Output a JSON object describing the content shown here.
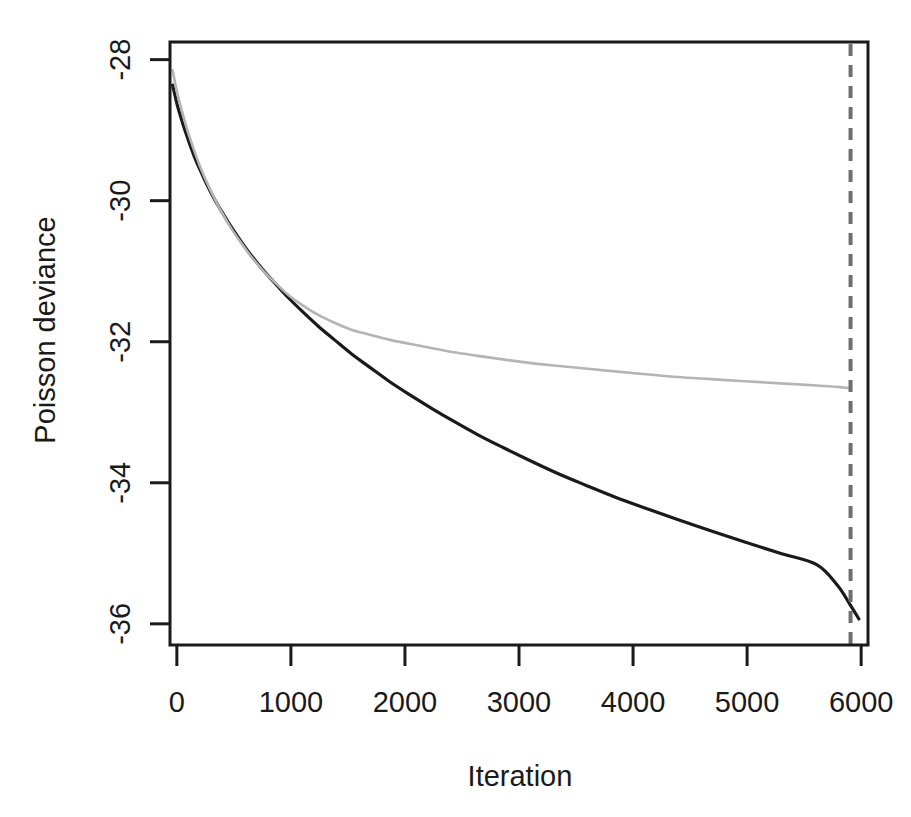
{
  "chart_data": {
    "type": "line",
    "title": "",
    "xlabel": "Iteration",
    "ylabel": "Poisson deviance",
    "xlim": [
      -60,
      6060
    ],
    "ylim": [
      -36.3,
      -27.75
    ],
    "grid": false,
    "legend": "none",
    "xticks": [
      0,
      1000,
      2000,
      3000,
      4000,
      5000,
      6000
    ],
    "xtick_labels": [
      "0",
      "1000",
      "2000",
      "3000",
      "4000",
      "5000",
      "6000"
    ],
    "yticks": [
      -28,
      -30,
      -32,
      -34,
      -36
    ],
    "ytick_labels": [
      "-28",
      "-30",
      "-32",
      "-34",
      "-36"
    ],
    "series": [
      {
        "name": "training deviance",
        "color": "#1a1a1a",
        "width": 3.2,
        "dash": "none",
        "x": [
          -37,
          0,
          30,
          60,
          100,
          150,
          200,
          260,
          330,
          400,
          480,
          560,
          650,
          750,
          860,
          980,
          1100,
          1240,
          1380,
          1530,
          1690,
          1860,
          2040,
          2230,
          2430,
          2640,
          2860,
          3090,
          3330,
          3580,
          3840,
          4110,
          4390,
          4680,
          4980,
          5290,
          5610,
          5790,
          5900,
          5980
        ],
        "y": [
          -28.36,
          -28.62,
          -28.79,
          -28.95,
          -29.14,
          -29.36,
          -29.55,
          -29.76,
          -29.98,
          -30.17,
          -30.38,
          -30.57,
          -30.77,
          -30.97,
          -31.17,
          -31.38,
          -31.57,
          -31.78,
          -31.97,
          -32.17,
          -32.36,
          -32.56,
          -32.75,
          -32.94,
          -33.13,
          -33.32,
          -33.5,
          -33.68,
          -33.86,
          -34.03,
          -34.2,
          -34.36,
          -34.52,
          -34.68,
          -34.84,
          -35.0,
          -35.16,
          -35.45,
          -35.72,
          -35.93
        ]
      },
      {
        "name": "cross-validation deviance",
        "color": "#b4b4b4",
        "width": 2.6,
        "dash": "none",
        "x": [
          -37,
          0,
          30,
          60,
          100,
          150,
          200,
          260,
          330,
          400,
          480,
          560,
          650,
          750,
          860,
          980,
          1100,
          1240,
          1380,
          1530,
          1690,
          1860,
          2040,
          2230,
          2430,
          2640,
          2860,
          3090,
          3330,
          3580,
          3840,
          4110,
          4390,
          4680,
          4980,
          5290,
          5610,
          5790,
          5907
        ],
        "y": [
          -28.15,
          -28.45,
          -28.64,
          -28.82,
          -29.04,
          -29.28,
          -29.5,
          -29.73,
          -29.97,
          -30.18,
          -30.4,
          -30.59,
          -30.79,
          -30.98,
          -31.16,
          -31.34,
          -31.48,
          -31.62,
          -31.73,
          -31.83,
          -31.9,
          -31.97,
          -32.03,
          -32.09,
          -32.15,
          -32.2,
          -32.25,
          -32.3,
          -32.34,
          -32.38,
          -32.42,
          -32.46,
          -32.5,
          -32.53,
          -32.56,
          -32.59,
          -32.62,
          -32.64,
          -32.66
        ]
      }
    ],
    "annotations": [
      {
        "name": "best-iteration-line",
        "type": "vline",
        "x": 5907,
        "color": "#6e6e6e",
        "width": 4,
        "dash": "12 9"
      }
    ]
  }
}
